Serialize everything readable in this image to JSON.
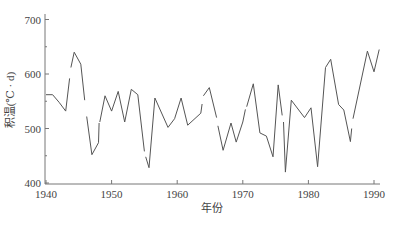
{
  "chart_data": {
    "type": "line",
    "title": "",
    "xlabel": "年份",
    "ylabel": "积温(℃ · d)",
    "xlim": [
      1940,
      1991
    ],
    "ylim": [
      400,
      700
    ],
    "x_ticks": [
      1940,
      1950,
      1960,
      1970,
      1980,
      1990
    ],
    "y_ticks": [
      400,
      500,
      600,
      700
    ],
    "y_minor_ticks": [
      450,
      550,
      650
    ],
    "grid": false,
    "legend": null,
    "line_color": "#555555",
    "segments": [
      {
        "x": [
          1940,
          1941,
          1942,
          1943,
          1943.6
        ],
        "y": [
          562,
          562,
          548,
          532,
          592
        ]
      },
      {
        "x": [
          1943.8,
          1944.3,
          1945.3,
          1945.9
        ],
        "y": [
          612,
          640,
          618,
          552
        ]
      },
      {
        "x": [
          1946.2,
          1947,
          1948,
          1948.1
        ],
        "y": [
          522,
          452,
          474,
          510
        ]
      },
      {
        "x": [
          1948.2,
          1949,
          1950,
          1951,
          1952,
          1953,
          1954,
          1955
        ],
        "y": [
          512,
          560,
          532,
          568,
          512,
          572,
          562,
          458
        ]
      },
      {
        "x": [
          1955.2,
          1955.7,
          1956.6,
          1958.6,
          1959.6,
          1960.6,
          1961.6,
          1963.6,
          1963.8
        ],
        "y": [
          448,
          428,
          556,
          502,
          518,
          556,
          506,
          528,
          545
        ]
      },
      {
        "x": [
          1964,
          1964.9,
          1966
        ],
        "y": [
          560,
          575,
          520
        ]
      },
      {
        "x": [
          1966.2,
          1967,
          1968.2,
          1969,
          1970,
          1970.4
        ],
        "y": [
          505,
          460,
          510,
          475,
          512,
          535
        ]
      },
      {
        "x": [
          1970.6,
          1971.6,
          1972.6,
          1973.6,
          1974.6,
          1975.4,
          1976
        ],
        "y": [
          540,
          582,
          492,
          486,
          448,
          580,
          524
        ]
      },
      {
        "x": [
          1976.2,
          1976.5,
          1977.4,
          1979.4,
          1980.4,
          1981.4,
          1982.6,
          1983.4,
          1984.6,
          1985.4,
          1986.4,
          1986.6
        ],
        "y": [
          512,
          420,
          552,
          520,
          538,
          430,
          612,
          627,
          544,
          534,
          476,
          500
        ]
      },
      {
        "x": [
          1986.8,
          1989,
          1990,
          1990.8
        ],
        "y": [
          518,
          642,
          604,
          645
        ]
      }
    ]
  }
}
